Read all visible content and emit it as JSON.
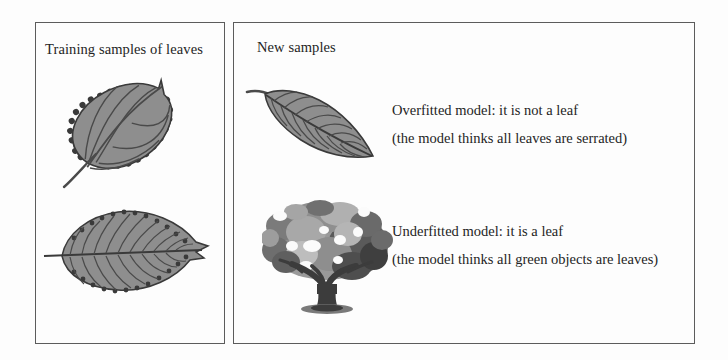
{
  "figure": {
    "background_color": "#fdfdfd",
    "border_color": "#5c5c5c",
    "leaf_fill_color": "#8e8e8e",
    "leaf_outline_color": "#3a3a3a",
    "vein_color": "#4a4a4a",
    "tree_dark_color": "#4a4a4a",
    "tree_mid_color": "#8a8a8a",
    "tree_light_color": "#bdbdbd"
  },
  "panels": {
    "training": {
      "title": "Training samples of leaves",
      "items": [
        {
          "name": "serrated-oval-leaf",
          "alt": "Serrated oval leaf with stem, tilted diagonally"
        },
        {
          "name": "serrated-elm-leaf",
          "alt": "Serrated elongated elm leaf, horizontal"
        }
      ]
    },
    "new_samples": {
      "title": "New samples",
      "items": [
        {
          "name": "smooth-edged-leaf",
          "alt": "Smooth-edged leaf angled down to the right",
          "caption_lines": [
            "Overfitted model: it is not a leaf",
            "(the model thinks all leaves are serrated)"
          ]
        },
        {
          "name": "tree-photograph",
          "alt": "Grayscale photograph of a broad tree",
          "caption_lines": [
            "Underfitted model: it is a leaf",
            "(the model thinks all green objects are leaves)"
          ]
        }
      ]
    }
  }
}
